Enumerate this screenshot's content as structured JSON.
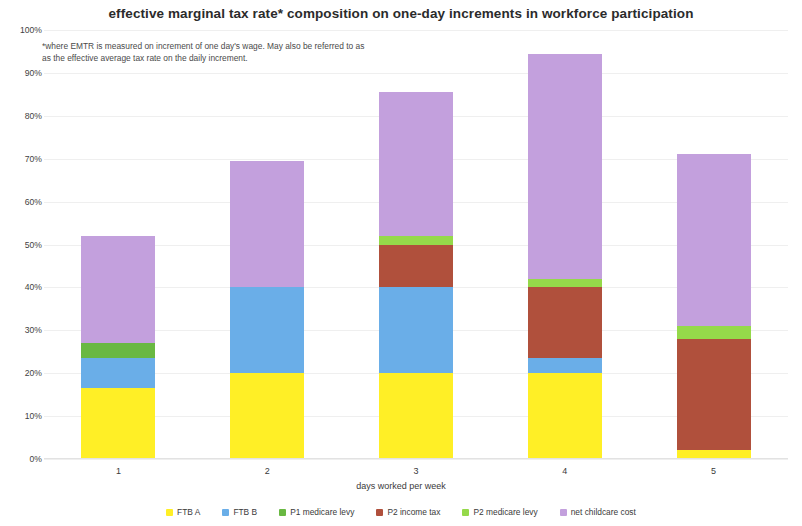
{
  "chart_data": {
    "type": "bar",
    "subtype": "stacked-bar-100-percent-axis",
    "title": "effective marginal tax rate* composition on one-day increments in workforce participation",
    "footnote": "*where EMTR is measured on increment of one day's wage. May also be referred to as as the effective average tax rate on the daily increment.",
    "xlabel": "days worked per week",
    "ylabel": "",
    "categories": [
      "1",
      "2",
      "3",
      "4",
      "5"
    ],
    "ylim": [
      0,
      100
    ],
    "ytick_labels": [
      "0%",
      "10%",
      "20%",
      "30%",
      "40%",
      "50%",
      "60%",
      "70%",
      "80%",
      "90%",
      "100%"
    ],
    "ytick_values": [
      0,
      10,
      20,
      30,
      40,
      50,
      60,
      70,
      80,
      90,
      100
    ],
    "grid": true,
    "legend_position": "bottom",
    "series": [
      {
        "name": "FTB A",
        "color": "#ffef26",
        "values": [
          16.5,
          20.0,
          20.0,
          20.0,
          2.0
        ]
      },
      {
        "name": "FTB B",
        "color": "#6aaee8",
        "values": [
          7.0,
          20.0,
          20.0,
          3.5,
          0.0
        ]
      },
      {
        "name": "P1 medicare levy",
        "color": "#69b842",
        "values": [
          3.5,
          0.0,
          0.0,
          0.0,
          0.0
        ]
      },
      {
        "name": "P2 income tax",
        "color": "#b0503c",
        "values": [
          0.0,
          0.0,
          10.0,
          16.5,
          26.0
        ]
      },
      {
        "name": "P2 medicare levy",
        "color": "#95d94a",
        "values": [
          0.0,
          0.0,
          2.0,
          2.0,
          3.0
        ]
      },
      {
        "name": "net childcare cost",
        "color": "#c3a0dd",
        "values": [
          25.0,
          29.5,
          33.5,
          52.5,
          40.0
        ]
      }
    ],
    "bar_totals": [
      52.0,
      69.5,
      85.5,
      94.5,
      71.0
    ]
  }
}
